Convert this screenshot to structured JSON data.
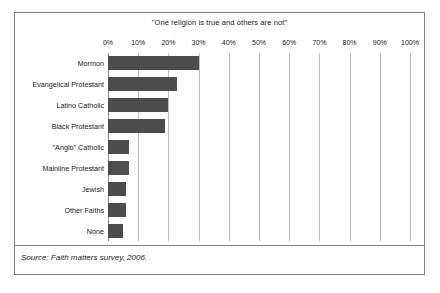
{
  "chart_data": {
    "type": "bar",
    "orientation": "horizontal",
    "title": "\"One religion is true and others are not\"",
    "xlabel": "",
    "ylabel": "",
    "xlim": [
      0,
      100
    ],
    "xticks": [
      0,
      10,
      20,
      30,
      40,
      50,
      60,
      70,
      80,
      90,
      100
    ],
    "xtick_labels": [
      "0%",
      "10%",
      "20%",
      "30%",
      "40%",
      "50%",
      "60%",
      "70%",
      "80%",
      "90%",
      "100%"
    ],
    "grid": "vertical",
    "legend": "none",
    "categories": [
      "Mormon",
      "Evangelical Protestant",
      "Latino Catholic",
      "Black Protestant",
      "\"Anglo\" Catholic",
      "Mainline Protestant",
      "Jewish",
      "Other Faiths",
      "None"
    ],
    "values": [
      30,
      23,
      20,
      19,
      7,
      7,
      6,
      6,
      5
    ],
    "bar_color": "#4d4d4d",
    "grid_color": "#bfbfbf",
    "axis_color": "#808080",
    "source": "Source: Faith matters survey, 2006."
  }
}
